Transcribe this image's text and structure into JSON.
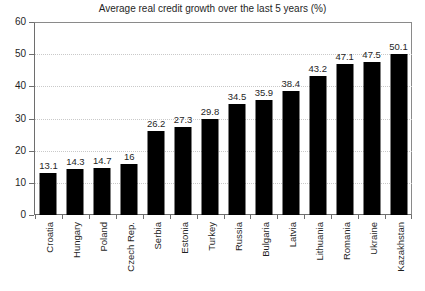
{
  "chart_data": {
    "type": "bar",
    "title": "Average real credit growth over the last 5 years (%)",
    "xlabel": "",
    "ylabel": "",
    "ylim": [
      0,
      60
    ],
    "yticks": [
      0,
      10,
      20,
      30,
      40,
      50,
      60
    ],
    "grid": true,
    "legend": null,
    "bar_color": "#000000",
    "categories": [
      "Croatia",
      "Hungary",
      "Poland",
      "Czech Rep.",
      "Serbia",
      "Estonia",
      "Turkey",
      "Russia",
      "Bulgaria",
      "Latvia",
      "Lithuania",
      "Romania",
      "Ukraine",
      "Kazakhstan"
    ],
    "values": [
      13.1,
      14.3,
      14.7,
      16,
      26.2,
      27.3,
      29.8,
      34.5,
      35.9,
      38.4,
      43.2,
      47.1,
      47.5,
      50.1
    ],
    "value_labels": [
      "13.1",
      "14.3",
      "14.7",
      "16",
      "26.2",
      "27.3",
      "29.8",
      "34.5",
      "35.9",
      "38.4",
      "43.2",
      "47.1",
      "47.5",
      "50.1"
    ]
  }
}
